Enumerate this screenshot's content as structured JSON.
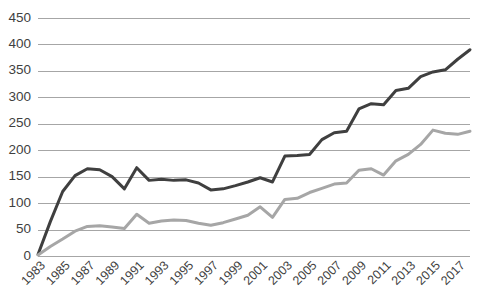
{
  "chart_data": {
    "type": "line",
    "title": "",
    "subtitle": "",
    "xlabel": "",
    "ylabel": "",
    "ylim": [
      0,
      450
    ],
    "ytick_step": 50,
    "ytick_labels": [
      "0",
      "50",
      "100",
      "150",
      "200",
      "250",
      "300",
      "350",
      "400",
      "450"
    ],
    "grid": true,
    "grid_axis": "y",
    "legend": "none",
    "legend_position": "none",
    "x": [
      1983,
      1984,
      1985,
      1986,
      1987,
      1988,
      1989,
      1990,
      1991,
      1992,
      1993,
      1994,
      1995,
      1996,
      1997,
      1998,
      1999,
      2000,
      2001,
      2002,
      2003,
      2004,
      2005,
      2006,
      2007,
      2008,
      2009,
      2010,
      2011,
      2012,
      2013,
      2014,
      2015,
      2016,
      2017,
      2018
    ],
    "xtick_labels": [
      "1983",
      "1985",
      "1987",
      "1989",
      "1991",
      "1993",
      "1995",
      "1997",
      "1999",
      "2001",
      "2003",
      "2005",
      "2007",
      "2009",
      "2011",
      "2013",
      "2015",
      "2017"
    ],
    "xtick_values": [
      1983,
      1985,
      1987,
      1989,
      1991,
      1993,
      1995,
      1997,
      1999,
      2001,
      2003,
      2005,
      2007,
      2009,
      2011,
      2013,
      2015,
      2017
    ],
    "series": [
      {
        "name": "dark-series",
        "color": "#3f3f3f",
        "width": 3,
        "values": [
          3,
          65,
          122,
          152,
          165,
          163,
          150,
          127,
          167,
          143,
          145,
          143,
          144,
          138,
          125,
          127,
          133,
          140,
          148,
          140,
          189,
          190,
          192,
          220,
          233,
          236,
          278,
          288,
          286,
          313,
          317,
          339,
          348,
          352,
          372,
          390
        ]
      },
      {
        "name": "light-series",
        "color": "#a6a6a6",
        "width": 3,
        "values": [
          2,
          18,
          32,
          47,
          56,
          57,
          55,
          52,
          79,
          62,
          66,
          68,
          67,
          62,
          58,
          63,
          70,
          77,
          93,
          73,
          107,
          109,
          120,
          128,
          136,
          138,
          162,
          165,
          153,
          180,
          192,
          211,
          238,
          232,
          230,
          236
        ]
      }
    ]
  },
  "plot_geometry": {
    "left": 38,
    "right": 470,
    "top": 18,
    "bottom": 256
  }
}
